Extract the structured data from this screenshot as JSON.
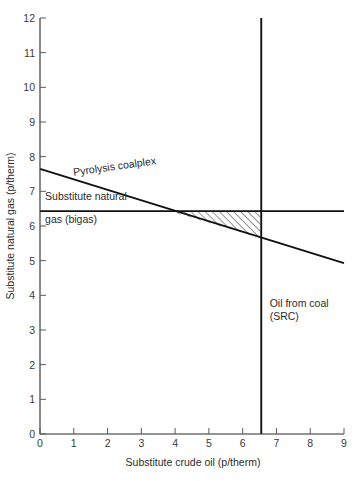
{
  "chart_data": {
    "type": "line",
    "title": "",
    "xlabel": "Substitute crude oil (p/therm)",
    "ylabel": "Substitute natural gas (p/therm)",
    "xlim": [
      0,
      9
    ],
    "ylim": [
      0,
      12
    ],
    "xticks": [
      0,
      1,
      2,
      3,
      4,
      5,
      6,
      7,
      8,
      9
    ],
    "yticks": [
      0,
      1,
      2,
      3,
      4,
      5,
      6,
      7,
      8,
      9,
      10,
      11,
      12
    ],
    "xtick_labels": [
      "0",
      "1",
      "2",
      "3",
      "4",
      "5",
      "6",
      "7",
      "8",
      "9"
    ],
    "ytick_labels": [
      "0",
      "1",
      "2",
      "3",
      "4",
      "5",
      "6",
      "7",
      "8",
      "9",
      "10",
      "11",
      "12"
    ],
    "grid": false,
    "legend_position": "inline-annotations",
    "series": [
      {
        "name": "Pyrolysis coalplex",
        "kind": "line",
        "x": [
          0,
          9
        ],
        "values": [
          7.65,
          4.93
        ]
      },
      {
        "name": "Substitute natural gas (bigas)",
        "kind": "horizontal-line",
        "x": [
          0,
          9
        ],
        "values": [
          6.43,
          6.43
        ]
      },
      {
        "name": "Oil from coal (SRC)",
        "kind": "vertical-line",
        "x": [
          6.55,
          6.55
        ],
        "values": [
          0,
          12
        ]
      }
    ],
    "annotations": [
      {
        "name": "pyrolysis-coalplex-label",
        "text": "Pyrolysis coalplex",
        "x": 1.0,
        "y": 7.45,
        "rotation": -8
      },
      {
        "name": "bigas-label-line1",
        "text": "Substitute natural",
        "x": 0.15,
        "y": 6.75
      },
      {
        "name": "bigas-label-line2",
        "text": "gas (bigas)",
        "x": 0.15,
        "y": 6.1
      },
      {
        "name": "src-label-line1",
        "text": "Oil from coal",
        "x": 6.8,
        "y": 3.65
      },
      {
        "name": "src-label-line2",
        "text": "(SRC)",
        "x": 6.8,
        "y": 3.3
      }
    ],
    "shaded_region": {
      "name": "advantage-triangle",
      "pattern": "diagonal-hatch",
      "vertices_x": [
        3.78,
        6.55,
        6.55
      ],
      "vertices_y": [
        6.43,
        6.43,
        5.65
      ]
    }
  },
  "labels": {
    "x_axis_title": "Substitute crude oil (p/therm)",
    "y_axis_title": "Substitute natural gas (p/therm)"
  }
}
